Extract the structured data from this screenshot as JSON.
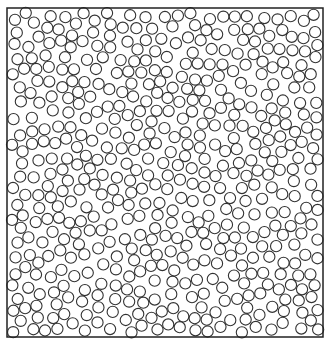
{
  "figure": {
    "type": "random-disk-packing",
    "background": "#ffffff",
    "stroke_color": "#333333",
    "box": {
      "x": 7,
      "y": 8,
      "width": 316,
      "height": 329,
      "stroke_width": 1.5,
      "color": "#222222"
    },
    "disks": {
      "radius": 5.6,
      "stroke_width": 1.1,
      "fill": "none",
      "target_count": 640,
      "min_center_distance": 11.4,
      "seed": 20240611,
      "max_attempts": 60000
    }
  }
}
